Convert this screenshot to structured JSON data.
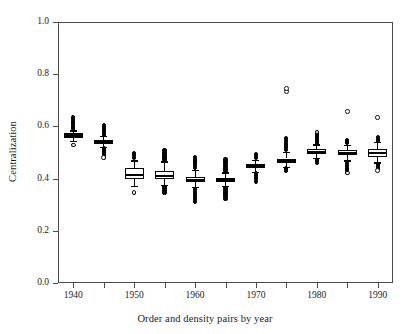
{
  "chart_data": {
    "type": "boxplot",
    "title": "",
    "xlabel": "Order and density pairs by year",
    "ylabel": "Centralization",
    "xlim": [
      1937.5,
      1992.5
    ],
    "ylim": [
      0.0,
      1.0
    ],
    "grid": false,
    "legend": null,
    "ytick_labels": [
      "0.0",
      "0.2",
      "0.4",
      "0.6",
      "0.8",
      "1.0"
    ],
    "ytick_values": [
      0.0,
      0.2,
      0.4,
      0.6,
      0.8,
      1.0
    ],
    "xtick_labels": [
      "1940",
      "",
      "1950",
      "",
      "1960",
      "",
      "1970",
      "",
      "1980",
      "",
      "1990"
    ],
    "xtick_values": [
      1940,
      1945,
      1950,
      1955,
      1960,
      1965,
      1970,
      1975,
      1980,
      1985,
      1990
    ],
    "categories": [
      1940,
      1945,
      1950,
      1955,
      1960,
      1965,
      1970,
      1975,
      1980,
      1985,
      1990
    ],
    "boxes": [
      {
        "x": 1940,
        "median": 0.565,
        "q1": 0.556,
        "q3": 0.573,
        "whisker_low": 0.545,
        "whisker_high": 0.585,
        "outliers_high": [
          0.592,
          0.598,
          0.603,
          0.608,
          0.613,
          0.618,
          0.622,
          0.627,
          0.631,
          0.635
        ],
        "outliers_low": [
          0.528
        ]
      },
      {
        "x": 1945,
        "median": 0.54,
        "q1": 0.532,
        "q3": 0.549,
        "whisker_low": 0.52,
        "whisker_high": 0.563,
        "outliers_high": [
          0.568,
          0.574,
          0.579,
          0.585,
          0.59,
          0.594,
          0.599,
          0.604
        ],
        "outliers_low": [
          0.515,
          0.51,
          0.504,
          0.498,
          0.492,
          0.486,
          0.48
        ]
      },
      {
        "x": 1950,
        "median": 0.414,
        "q1": 0.4,
        "q3": 0.441,
        "whisker_low": 0.373,
        "whisker_high": 0.47,
        "outliers_high": [
          0.478,
          0.486,
          0.493,
          0.499
        ],
        "outliers_low": [
          0.346
        ]
      },
      {
        "x": 1955,
        "median": 0.41,
        "q1": 0.398,
        "q3": 0.43,
        "whisker_low": 0.376,
        "whisker_high": 0.466,
        "outliers_high": [
          0.473,
          0.479,
          0.485,
          0.491,
          0.497,
          0.503,
          0.509
        ],
        "outliers_low": [
          0.369,
          0.363,
          0.357,
          0.352,
          0.347
        ]
      },
      {
        "x": 1960,
        "median": 0.396,
        "q1": 0.386,
        "q3": 0.408,
        "whisker_low": 0.368,
        "whisker_high": 0.434,
        "outliers_high": [
          0.441,
          0.448,
          0.455,
          0.462,
          0.469,
          0.476,
          0.483
        ],
        "outliers_low": [
          0.36,
          0.352,
          0.344,
          0.337,
          0.33,
          0.322,
          0.315,
          0.309
        ]
      },
      {
        "x": 1965,
        "median": 0.395,
        "q1": 0.387,
        "q3": 0.404,
        "whisker_low": 0.372,
        "whisker_high": 0.424,
        "outliers_high": [
          0.431,
          0.438,
          0.445,
          0.452,
          0.459,
          0.466,
          0.473
        ],
        "outliers_low": [
          0.364,
          0.357,
          0.35,
          0.343,
          0.336,
          0.329,
          0.322
        ]
      },
      {
        "x": 1970,
        "median": 0.448,
        "q1": 0.44,
        "q3": 0.457,
        "whisker_low": 0.426,
        "whisker_high": 0.472,
        "outliers_high": [
          0.478,
          0.483,
          0.489,
          0.494
        ],
        "outliers_low": [
          0.42,
          0.414,
          0.409,
          0.403,
          0.397,
          0.391,
          0.386
        ]
      },
      {
        "x": 1975,
        "median": 0.468,
        "q1": 0.459,
        "q3": 0.477,
        "whisker_low": 0.445,
        "whisker_high": 0.502,
        "outliers_high": [
          0.509,
          0.516,
          0.523,
          0.53,
          0.537,
          0.544,
          0.551,
          0.557
        ],
        "outliers_low": [
          0.439,
          0.433,
          0.428
        ],
        "far_outliers": [
          0.733,
          0.746
        ]
      },
      {
        "x": 1980,
        "median": 0.503,
        "q1": 0.494,
        "q3": 0.512,
        "whisker_low": 0.478,
        "whisker_high": 0.531,
        "outliers_high": [
          0.537,
          0.543,
          0.549,
          0.555,
          0.561,
          0.567,
          0.573,
          0.578
        ],
        "outliers_low": [
          0.472,
          0.466,
          0.461
        ]
      },
      {
        "x": 1985,
        "median": 0.499,
        "q1": 0.49,
        "q3": 0.508,
        "whisker_low": 0.47,
        "whisker_high": 0.53,
        "outliers_high": [
          0.536,
          0.542,
          0.548
        ],
        "outliers_low": [
          0.463,
          0.456,
          0.449,
          0.442,
          0.435,
          0.428,
          0.422
        ],
        "far_outliers": [
          0.657
        ]
      },
      {
        "x": 1990,
        "median": 0.497,
        "q1": 0.484,
        "q3": 0.512,
        "whisker_low": 0.462,
        "whisker_high": 0.54,
        "outliers_high": [
          0.546,
          0.552,
          0.558
        ],
        "outliers_low": [
          0.456,
          0.45,
          0.444,
          0.438,
          0.432
        ],
        "far_outliers": [
          0.634
        ]
      }
    ]
  }
}
